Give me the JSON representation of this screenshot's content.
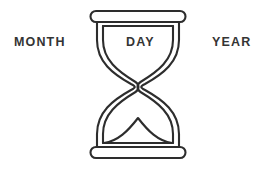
{
  "canvas": {
    "width": 271,
    "height": 172,
    "background_color": "#ffffff"
  },
  "labels": {
    "left": "MONTH",
    "center": "DAY",
    "right": "YEAR",
    "text_color": "#343434"
  },
  "illustration": {
    "name": "hourglass",
    "style": "double-line outline",
    "stroke_color": "#2d2d2d",
    "fill_color": "none",
    "stroke_width": 2,
    "parts": {
      "top_cap": "rounded-bar",
      "upper_bulb": "funnel",
      "neck": "pinched",
      "lower_bulb": "funnel",
      "sand_mound": "peaked-curve",
      "bottom_cap": "rounded-bar"
    }
  }
}
